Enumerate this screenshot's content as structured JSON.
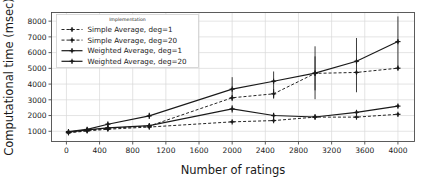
{
  "chart_data": {
    "type": "line",
    "title": "",
    "xlabel": "Number of ratings",
    "ylabel": "Computational time (msec)",
    "xlim": [
      -180,
      4200
    ],
    "ylim": [
      350,
      8550
    ],
    "xticks": [
      0,
      400,
      800,
      1200,
      1600,
      2000,
      2400,
      2800,
      3200,
      3600,
      4000
    ],
    "yticks": [
      1000,
      2000,
      3000,
      4000,
      5000,
      6000,
      7000,
      8000
    ],
    "grid": true,
    "legend_position": "upper left",
    "legend_title": "Implementation",
    "x": [
      25,
      250,
      500,
      1000,
      2000,
      2500,
      3000,
      3500,
      4000
    ],
    "series": [
      {
        "name": "Simple Average, deg=1",
        "linestyle": "dashed",
        "color": "#1a1a1a",
        "values": [
          900,
          1020,
          1130,
          1270,
          1600,
          1680,
          1900,
          1900,
          2080
        ],
        "err_low": [
          820,
          940,
          1060,
          1190,
          1520,
          1600,
          1830,
          1820,
          1990
        ],
        "err_high": [
          980,
          1100,
          1210,
          1350,
          1680,
          1760,
          1980,
          1980,
          2170
        ]
      },
      {
        "name": "Simple Average, deg=20",
        "linestyle": "dashed",
        "color": "#1a1a1a",
        "values": [
          930,
          1060,
          1190,
          1330,
          3130,
          3380,
          4680,
          4740,
          5010
        ],
        "err_low": [
          860,
          980,
          1100,
          1240,
          2980,
          3080,
          3600,
          4620,
          4880
        ],
        "err_high": [
          1000,
          1140,
          1280,
          1420,
          3280,
          3680,
          5760,
          4860,
          5140
        ]
      },
      {
        "name": "Weighted Average, deg=1",
        "linestyle": "solid",
        "color": "#1a1a1a",
        "values": [
          950,
          1090,
          1220,
          1360,
          2420,
          2000,
          1910,
          2200,
          2600
        ],
        "err_low": [
          870,
          1000,
          1130,
          1270,
          2180,
          1820,
          1840,
          2060,
          2480
        ],
        "err_high": [
          1030,
          1180,
          1310,
          1450,
          2660,
          2180,
          1980,
          2340,
          2720
        ]
      },
      {
        "name": "Weighted Average, deg=20",
        "linestyle": "solid",
        "color": "#1a1a1a",
        "values": [
          980,
          1120,
          1450,
          1980,
          3680,
          4180,
          4700,
          5450,
          6700
        ],
        "err_low": [
          900,
          1030,
          1300,
          1780,
          2920,
          3100,
          3040,
          3480,
          5030
        ],
        "err_high": [
          1060,
          1210,
          1600,
          2180,
          4440,
          4800,
          6400,
          6930,
          8300
        ]
      }
    ]
  }
}
